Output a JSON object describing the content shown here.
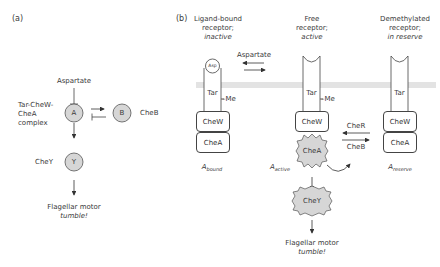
{
  "panel_a": {
    "label": "(a)",
    "aspartate": "Aspartate",
    "complex_label_line1": "Tar-CheW-",
    "complex_label_line2": "CheA",
    "complex_label_line3": "complex",
    "node_a": "A",
    "node_b": "B",
    "cheb_label": "CheB",
    "chey_label": "CheY",
    "node_y": "Y",
    "output_line1": "Flagellar motor",
    "output_line2": "tumble!"
  },
  "panel_b": {
    "label": "(b)",
    "col1_line1": "Ligand-bound",
    "col1_line2": "receptor;",
    "col1_line3": "inactive",
    "col2_line1": "Free",
    "col2_line2": "receptor;",
    "col2_line3": "active",
    "col3_line1": "Demethylated",
    "col3_line2": "receptor;",
    "col3_line3": "in reserve",
    "aspartate": "Aspartate",
    "asp_ligand": "Asp",
    "tar": "Tar",
    "me": "–Me",
    "chew": "CheW",
    "chea": "CheA",
    "chey": "CheY",
    "cher": "CheR",
    "cheb": "CheB",
    "a_bound_main": "A",
    "a_bound_sub": "bound",
    "a_active_main": "A",
    "a_active_sub": "active",
    "a_reserve_main": "A",
    "a_reserve_sub": "reserve",
    "output_line1": "Flagellar motor",
    "output_line2": "tumble!"
  },
  "colors": {
    "node_fill": "#d6d6d6",
    "membrane": "#e3e3e3",
    "stroke": "#444444"
  }
}
